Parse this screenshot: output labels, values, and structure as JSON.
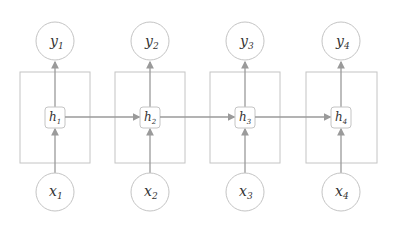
{
  "diagram": {
    "colors": {
      "stroke": "#9a9a9a",
      "box": "#b8b8b8",
      "text": "#333333"
    },
    "steps": [
      {
        "cx": 55,
        "y_label": "y",
        "y_sub": "1",
        "h_label": "h",
        "h_sub": "1",
        "x_label": "x",
        "x_sub": "1"
      },
      {
        "cx": 150,
        "y_label": "y",
        "y_sub": "2",
        "h_label": "h",
        "h_sub": "2",
        "x_label": "x",
        "x_sub": "2"
      },
      {
        "cx": 245,
        "y_label": "y",
        "y_sub": "3",
        "h_label": "h",
        "h_sub": "3",
        "x_label": "x",
        "x_sub": "3"
      },
      {
        "cx": 341,
        "y_label": "y",
        "y_sub": "4",
        "h_label": "h",
        "h_sub": "4",
        "x_label": "x",
        "x_sub": "4"
      }
    ]
  }
}
